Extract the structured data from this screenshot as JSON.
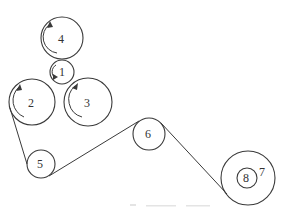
{
  "diagram": {
    "type": "roller-belt-schematic",
    "colors": {
      "stroke": "#3a3a3a",
      "label": "#333333",
      "background": "#ffffff"
    },
    "rollers": [
      {
        "id": "4",
        "label": "4",
        "cx": 62,
        "cy": 38,
        "r": 21,
        "rotation_arrow": "counterclockwise"
      },
      {
        "id": "1",
        "label": "1",
        "cx": 62,
        "cy": 72,
        "r": 12,
        "rotation_arrow": "counterclockwise"
      },
      {
        "id": "2",
        "label": "2",
        "cx": 32,
        "cy": 102,
        "r": 23,
        "rotation_arrow": "counterclockwise"
      },
      {
        "id": "3",
        "label": "3",
        "cx": 88,
        "cy": 102,
        "r": 24,
        "rotation_arrow": "clockwise"
      },
      {
        "id": "5",
        "label": "5",
        "cx": 41,
        "cy": 164,
        "r": 14
      },
      {
        "id": "6",
        "label": "6",
        "cx": 149,
        "cy": 134,
        "r": 16
      },
      {
        "id": "7",
        "label": "7",
        "cx": 248,
        "cy": 178,
        "r": 27
      },
      {
        "id": "8",
        "label": "8",
        "cx": 247,
        "cy": 178,
        "r": 10
      }
    ],
    "belt_segments": [
      {
        "from": "2",
        "to": "5",
        "x1": 10,
        "y1": 108,
        "x2": 27,
        "y2": 164
      },
      {
        "from": "5",
        "to": "6",
        "x1": 49,
        "y1": 176,
        "x2": 139,
        "y2": 121
      },
      {
        "from": "6",
        "to": "7",
        "x1": 161,
        "y1": 123,
        "x2": 227,
        "y2": 194
      }
    ],
    "labels": {
      "roller_1": "1",
      "roller_2": "2",
      "roller_3": "3",
      "roller_4": "4",
      "roller_5": "5",
      "roller_6": "6",
      "roller_7": "7",
      "roller_8": "8"
    }
  }
}
